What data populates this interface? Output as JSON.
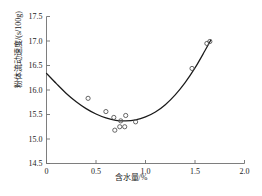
{
  "chart_data": {
    "type": "scatter",
    "title": "",
    "xlabel": "含水量/%",
    "ylabel": "粉体流动速度/(s/100g)",
    "xlim": [
      0,
      2.0
    ],
    "ylim": [
      14.5,
      17.5
    ],
    "xticks": [
      "0",
      "0.5",
      "1.0",
      "1.5",
      "2.0"
    ],
    "xtick_values": [
      0,
      0.5,
      1.0,
      1.5,
      2.0
    ],
    "yticks": [
      "14.5",
      "15.0",
      "15.5",
      "16.0",
      "16.5",
      "17.0",
      "17.5"
    ],
    "ytick_values": [
      14.5,
      15.0,
      15.5,
      16.0,
      16.5,
      17.0,
      17.5
    ],
    "grid": false,
    "legend": "none",
    "marker": "open-circle",
    "series": [
      {
        "name": "测量点",
        "points": [
          {
            "x": 0.42,
            "y": 15.83
          },
          {
            "x": 0.6,
            "y": 15.56
          },
          {
            "x": 0.68,
            "y": 15.44
          },
          {
            "x": 0.69,
            "y": 15.18
          },
          {
            "x": 0.74,
            "y": 15.25
          },
          {
            "x": 0.75,
            "y": 15.37
          },
          {
            "x": 0.79,
            "y": 15.25
          },
          {
            "x": 0.8,
            "y": 15.48
          },
          {
            "x": 0.9,
            "y": 15.35
          },
          {
            "x": 1.47,
            "y": 16.44
          },
          {
            "x": 1.62,
            "y": 16.95
          },
          {
            "x": 1.65,
            "y": 16.99
          }
        ]
      }
    ],
    "fit_curve": {
      "name": "拟合曲线",
      "shape": "parabola",
      "vertex": {
        "x": 0.8,
        "y": 15.37
      },
      "endpoints": [
        {
          "x": 0.0,
          "y": 16.34
        },
        {
          "x": 1.66,
          "y": 17.0
        }
      ],
      "points": [
        {
          "x": 0.0,
          "y": 16.34
        },
        {
          "x": 0.1,
          "y": 16.13
        },
        {
          "x": 0.2,
          "y": 15.93
        },
        {
          "x": 0.3,
          "y": 15.76
        },
        {
          "x": 0.4,
          "y": 15.62
        },
        {
          "x": 0.5,
          "y": 15.51
        },
        {
          "x": 0.6,
          "y": 15.43
        },
        {
          "x": 0.7,
          "y": 15.38
        },
        {
          "x": 0.8,
          "y": 15.37
        },
        {
          "x": 0.9,
          "y": 15.39
        },
        {
          "x": 1.0,
          "y": 15.45
        },
        {
          "x": 1.1,
          "y": 15.55
        },
        {
          "x": 1.2,
          "y": 15.7
        },
        {
          "x": 1.3,
          "y": 15.9
        },
        {
          "x": 1.4,
          "y": 16.15
        },
        {
          "x": 1.5,
          "y": 16.45
        },
        {
          "x": 1.6,
          "y": 16.8
        },
        {
          "x": 1.66,
          "y": 17.02
        }
      ]
    },
    "colors": {
      "curve": "#1a1a1a",
      "marker_stroke": "#555555",
      "axis": "#6f6f6f",
      "text": "#1a1a1a",
      "background": "#ffffff"
    }
  }
}
